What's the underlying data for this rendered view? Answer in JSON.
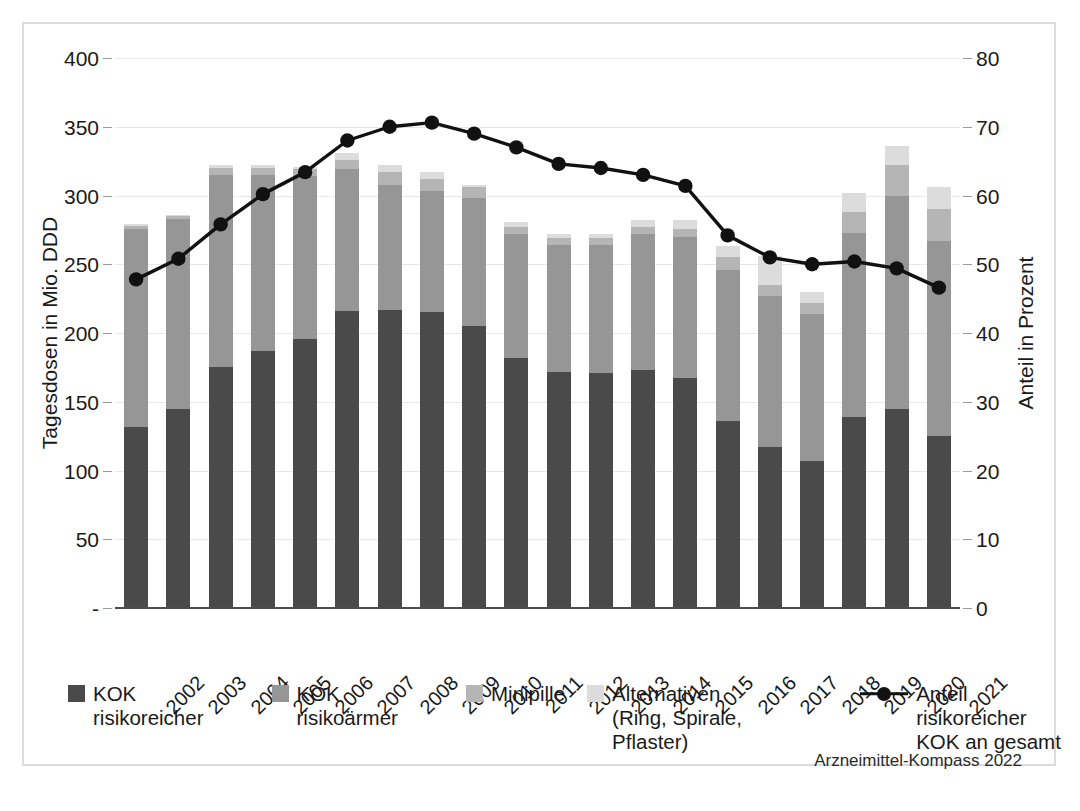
{
  "chart_data": {
    "type": "bar",
    "subtype": "stacked-bar-with-line-overlay",
    "title": "",
    "xlabel": "",
    "ylabel": "Tagesdosen in Mio. DDD",
    "y2label": "Anteil in Prozent",
    "ylim": [
      0,
      400
    ],
    "y2lim": [
      0,
      80
    ],
    "yticks": [
      "-",
      "50",
      "100",
      "150",
      "200",
      "250",
      "300",
      "350",
      "400"
    ],
    "ytick_values": [
      0,
      50,
      100,
      150,
      200,
      250,
      300,
      350,
      400
    ],
    "y2ticks": [
      "0",
      "10",
      "20",
      "30",
      "40",
      "50",
      "60",
      "70",
      "80"
    ],
    "y2tick_values": [
      0,
      10,
      20,
      30,
      40,
      50,
      60,
      70,
      80
    ],
    "grid": true,
    "legend_position": "bottom",
    "categories": [
      "2002",
      "2003",
      "2004",
      "2005",
      "2006",
      "2007",
      "2008",
      "2009",
      "2010",
      "2011",
      "2012",
      "2013",
      "2014",
      "2015",
      "2016",
      "2017",
      "2018",
      "2019",
      "2020",
      "2021"
    ],
    "series": [
      {
        "name": "KOK risikoreicher",
        "color": "#4a4a4a",
        "values": [
          132,
          145,
          175,
          187,
          196,
          216,
          217,
          215,
          205,
          182,
          172,
          171,
          173,
          167,
          136,
          117,
          107,
          139,
          145,
          125
        ]
      },
      {
        "name": "KOK risikoärmer",
        "color": "#969696",
        "values": [
          144,
          138,
          140,
          128,
          118,
          103,
          91,
          88,
          93,
          90,
          92,
          93,
          99,
          103,
          110,
          110,
          107,
          134,
          155,
          142
        ]
      },
      {
        "name": "Minipille",
        "color": "#b5b5b5",
        "values": [
          2,
          2,
          5,
          5,
          5,
          7,
          9,
          9,
          8,
          5,
          5,
          5,
          5,
          6,
          9,
          8,
          8,
          15,
          22,
          23
        ]
      },
      {
        "name": "Alternativen\n(Ring, Spirale, Pflaster)",
        "color": "#dcdcdc",
        "values": [
          1,
          1,
          2,
          2,
          2,
          5,
          5,
          5,
          2,
          4,
          3,
          3,
          5,
          6,
          8,
          21,
          8,
          14,
          14,
          16
        ]
      }
    ],
    "line_series": {
      "name": "Anteil risikoreicher\nKOK an gesamt",
      "color": "#111111",
      "axis": "right",
      "unit": "%",
      "values": [
        47.8,
        50.8,
        55.8,
        60.2,
        63.4,
        68.0,
        70.0,
        70.6,
        69.0,
        67.0,
        64.6,
        64.0,
        63.0,
        61.4,
        54.2,
        51.0,
        50.0,
        50.4,
        49.4,
        46.6
      ]
    }
  },
  "axes": {
    "left_title": "Tagesdosen in Mio. DDD",
    "right_title": "Anteil in Prozent"
  },
  "legend": {
    "items": [
      {
        "label": "KOK risikoreicher",
        "color": "#4a4a4a",
        "kind": "swatch"
      },
      {
        "label": "KOK risikoärmer",
        "color": "#969696",
        "kind": "swatch"
      },
      {
        "label": "Minipille",
        "color": "#b5b5b5",
        "kind": "swatch"
      },
      {
        "label": "Alternativen\n(Ring, Spirale, Pflaster)",
        "color": "#dcdcdc",
        "kind": "swatch"
      },
      {
        "label": "Anteil risikoreicher\nKOK an gesamt",
        "color": "#111111",
        "kind": "line-marker"
      }
    ]
  },
  "source": {
    "text": "Arzneimittel-Kompass 2022"
  },
  "colors": {
    "frame_border": "#dcdcdc",
    "gridline": "#e8e8e8",
    "baseline": "#4d4d4d",
    "text": "#1a1a1a",
    "background": "#ffffff"
  }
}
